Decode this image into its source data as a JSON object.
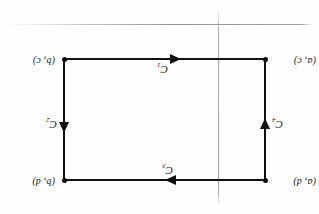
{
  "figure": {
    "kind": "rectangle-contour-diagram",
    "orientation_note": "upside-down scan",
    "ink_color": "#111114",
    "artifact_color": "#8a8a8f",
    "background_color": "#fefefe"
  },
  "vertices": {
    "top_left": "(b, c)",
    "top_right": "(a, c)",
    "bottom_left": "(b, d)",
    "bottom_right": "(a, d)"
  },
  "curves": [
    {
      "id": "C1",
      "label": "C",
      "subscript": "1",
      "edge": "top",
      "direction": "leftward"
    },
    {
      "id": "C2",
      "label": "C",
      "subscript": "2",
      "edge": "left",
      "direction": "downward"
    },
    {
      "id": "C3",
      "label": "C",
      "subscript": "3",
      "edge": "bottom",
      "direction": "rightward"
    },
    {
      "id": "C4",
      "label": "C",
      "subscript": "4",
      "edge": "right",
      "direction": "upward"
    }
  ]
}
